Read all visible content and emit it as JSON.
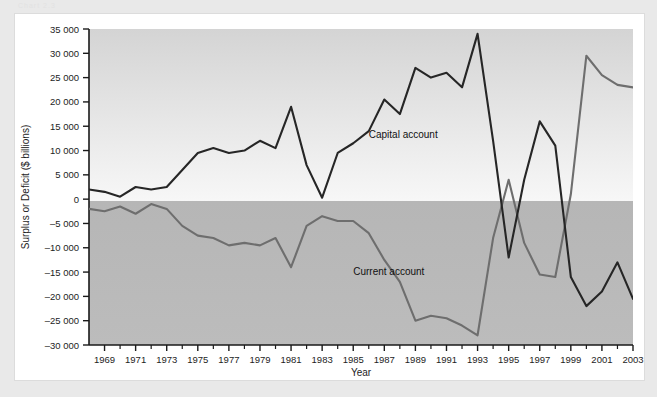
{
  "watermark": "Chart 2.3",
  "chart_data": {
    "type": "line",
    "title": "",
    "xlabel": "Year",
    "ylabel": "Surplus or Deficit ($ billions)",
    "xlim": [
      1968,
      2003
    ],
    "ylim": [
      -30000,
      35000
    ],
    "ytick_step": 5000,
    "yticks": [
      35000,
      30000,
      25000,
      20000,
      15000,
      10000,
      5000,
      0,
      -5000,
      -10000,
      -15000,
      -20000,
      -25000,
      -30000
    ],
    "ytick_labels": [
      "35 000",
      "30 000",
      "25 000",
      "20 000",
      "15 000",
      "10 000",
      "5 000",
      "0",
      "-5 000",
      "-10 000",
      "-15 000",
      "-20 000",
      "-25 000",
      "-30 000"
    ],
    "xticks": [
      1969,
      1971,
      1973,
      1975,
      1977,
      1979,
      1981,
      1983,
      1985,
      1987,
      1989,
      1991,
      1993,
      1995,
      1997,
      1999,
      2001,
      2003
    ],
    "xtick_labels": [
      "1969",
      "1971",
      "1973",
      "1975",
      "1977",
      "1979",
      "1981",
      "1983",
      "1985",
      "1987",
      "1989",
      "1991",
      "1993",
      "1995",
      "1997",
      "1999",
      "2001",
      "2003"
    ],
    "x": [
      1968,
      1969,
      1970,
      1971,
      1972,
      1973,
      1974,
      1975,
      1976,
      1977,
      1978,
      1979,
      1980,
      1981,
      1982,
      1983,
      1984,
      1985,
      1986,
      1987,
      1988,
      1989,
      1990,
      1991,
      1992,
      1993,
      1994,
      1995,
      1996,
      1997,
      1998,
      1999,
      2000,
      2001,
      2002,
      2003
    ],
    "grid": false,
    "legend_position": "inline-annotations",
    "series": [
      {
        "name": "Capital account",
        "color": "#262626",
        "label_text": "Capital account",
        "label_x": 1986,
        "label_y": 12500,
        "values": [
          2000,
          1500,
          500,
          2500,
          2000,
          2500,
          6000,
          9500,
          10500,
          9500,
          10000,
          12000,
          10500,
          19000,
          7000,
          300,
          9500,
          11500,
          14000,
          20500,
          17500,
          27000,
          25000,
          26000,
          23000,
          34000,
          12000,
          -12000,
          4000,
          16000,
          11000,
          -16000,
          -22000,
          -19000,
          -13000,
          -20500
        ]
      },
      {
        "name": "Current account",
        "color": "#6e6e6e",
        "label_text": "Current account",
        "label_x": 1985,
        "label_y": -15500,
        "values": [
          -2000,
          -2500,
          -1500,
          -3000,
          -1000,
          -2000,
          -5500,
          -7500,
          -8000,
          -9500,
          -9000,
          -9500,
          -8000,
          -14000,
          -5500,
          -3500,
          -4500,
          -4500,
          -7000,
          -12500,
          -17000,
          -25000,
          -24000,
          -24500,
          -26000,
          -28000,
          -8000,
          4000,
          -9000,
          -15500,
          -16000,
          1000,
          29500,
          25500,
          23500,
          23000
        ]
      }
    ]
  }
}
